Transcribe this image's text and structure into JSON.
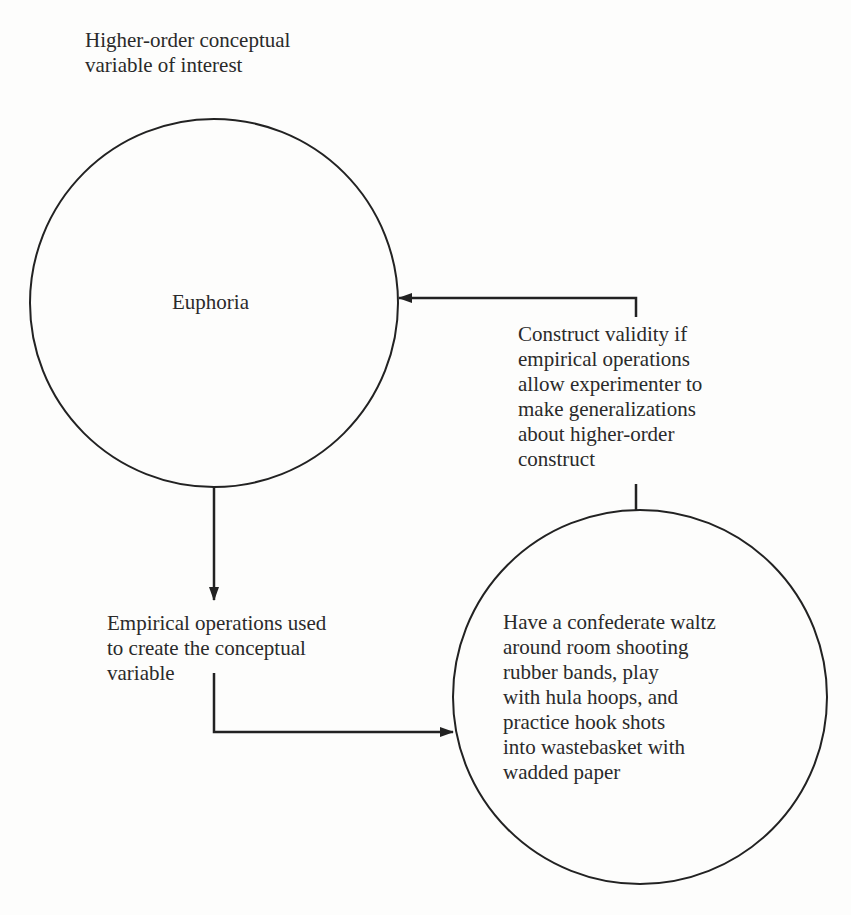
{
  "labels": {
    "top_caption": "Higher-order conceptual\nvariable of interest",
    "conceptual_variable": "Euphoria",
    "construct_validity": "Construct validity if\nempirical operations\nallow experimenter to\nmake generalizations\nabout higher-order\nconstruct",
    "empirical_caption": "Empirical operations used\nto create the conceptual\nvariable",
    "operations": "Have a confederate waltz\naround room shooting\nrubber bands, play\nwith hula hoops, and\npractice hook shots\ninto wastebasket with\nwadded paper"
  },
  "colors": {
    "stroke": "#222222",
    "text": "#2a2a2a",
    "background": "#fdfdfc"
  }
}
